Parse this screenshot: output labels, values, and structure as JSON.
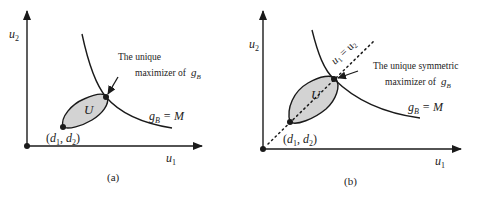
{
  "panels": [
    {
      "id": "a",
      "caption": "(a)",
      "x_axis_label": "u",
      "x_axis_sub": "1",
      "y_axis_label": "u",
      "y_axis_sub": "2",
      "region_label": "U",
      "disagreement_label": "(d",
      "disagreement_sub1": "1",
      "disagreement_mid": ", d",
      "disagreement_sub2": "2",
      "disagreement_close": ")",
      "curve_label_main": "g",
      "curve_label_sub": "B",
      "curve_label_eq": " = M",
      "annotation_line1": "The unique",
      "annotation_line2": "maximizer of",
      "annotation_g": "g",
      "annotation_sub": "B"
    },
    {
      "id": "b",
      "caption": "(b)",
      "x_axis_label": "u",
      "x_axis_sub": "1",
      "y_axis_label": "u",
      "y_axis_sub": "2",
      "region_label": "U",
      "disagreement_label": "(d",
      "disagreement_sub1": "1",
      "disagreement_mid": ", d",
      "disagreement_sub2": "2",
      "disagreement_close": ")",
      "curve_label_main": "g",
      "curve_label_sub": "B",
      "curve_label_eq": " = M",
      "symmetry_line_u1": "u",
      "symmetry_line_sub1": "1",
      "symmetry_line_eq": " = u",
      "symmetry_line_sub2": "2",
      "annotation_line1": "The unique symmetric",
      "annotation_line2": "maximizer of",
      "annotation_g": "g",
      "annotation_sub": "B"
    }
  ],
  "colors": {
    "region_fill": "#d3d3d3",
    "stroke": "#1a1a1a"
  }
}
